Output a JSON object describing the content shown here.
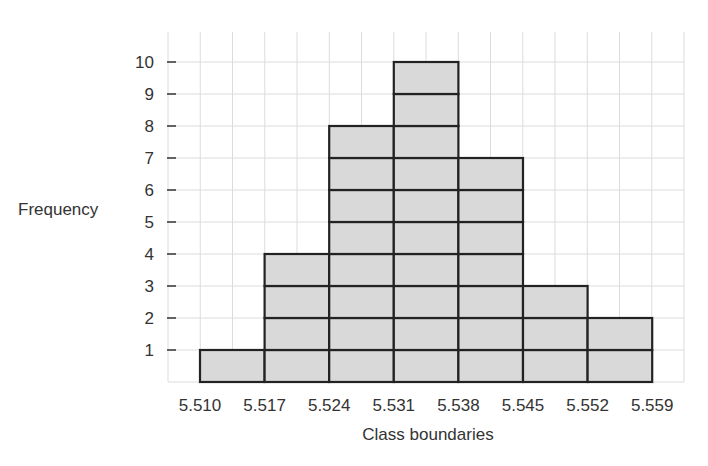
{
  "chart_data": {
    "type": "bar",
    "subtype": "histogram",
    "title": "",
    "xlabel": "Class boundaries",
    "ylabel": "Frequency",
    "x_boundaries": [
      "5.510",
      "5.517",
      "5.524",
      "5.531",
      "5.538",
      "5.545",
      "5.552",
      "5.559"
    ],
    "categories": [
      "5.510-5.517",
      "5.517-5.524",
      "5.524-5.531",
      "5.531-5.538",
      "5.538-5.545",
      "5.545-5.552",
      "5.552-5.559"
    ],
    "values": [
      1,
      4,
      8,
      10,
      7,
      3,
      2
    ],
    "y_ticks": [
      1,
      2,
      3,
      4,
      5,
      6,
      7,
      8,
      9,
      10
    ],
    "ylim": [
      0,
      11
    ],
    "grid": true,
    "legend": null,
    "bars_stacked_as_unit_blocks": true,
    "colors": {
      "bar_fill": "#d9d9d9",
      "bar_stroke": "#222222",
      "grid": "#dcdcdc"
    }
  }
}
